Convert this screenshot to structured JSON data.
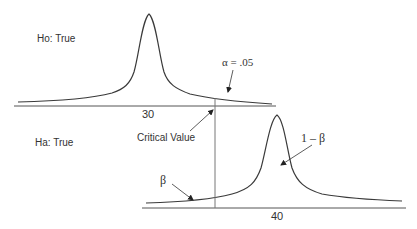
{
  "diagram": {
    "null_panel": {
      "label": "Ho: True",
      "mean_tick": "30",
      "alpha_label": "α = .05"
    },
    "alt_panel": {
      "label": "Ha: True",
      "mean_tick": "40",
      "power_label": "1 – β",
      "beta_label": "β"
    },
    "critical_value_label": "Critical Value",
    "colors": {
      "curve": "#3a3a3a",
      "axis": "#555555",
      "critical_line": "#777777",
      "text": "#333333"
    }
  }
}
